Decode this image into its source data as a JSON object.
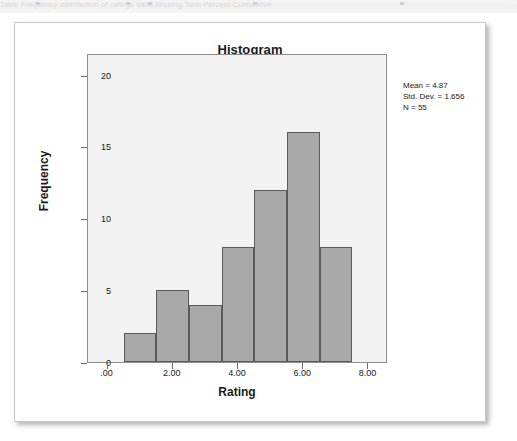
{
  "page": {
    "top_strip_ghost_text": "Table  Frequency distribution of ratings  Valid  Missing  Total  Percent  Cumulative"
  },
  "chart_data": {
    "type": "bar",
    "title": "Histogram",
    "xlabel": "Rating",
    "ylabel": "Frequency",
    "xlim": [
      -0.6,
      8.6
    ],
    "ylim": [
      0,
      21.5
    ],
    "grid": false,
    "legend": "none",
    "bin_width": 1,
    "bin_starts": [
      0.5,
      1.5,
      2.5,
      3.5,
      4.5,
      5.5,
      6.5
    ],
    "bin_ends": [
      1.5,
      2.5,
      3.5,
      4.5,
      5.5,
      6.5,
      7.5
    ],
    "categories": [
      "0.5-1.5",
      "1.5-2.5",
      "2.5-3.5",
      "3.5-4.5",
      "4.5-5.5",
      "5.5-6.5",
      "6.5-7.5"
    ],
    "values": [
      2,
      5,
      4,
      8,
      12,
      16,
      8
    ],
    "xticks": [
      0,
      2,
      4,
      6,
      8
    ],
    "xticklabels": [
      ".00",
      "2.00",
      "4.00",
      "6.00",
      "8.00"
    ],
    "yticks": [
      0,
      5,
      10,
      15,
      20
    ],
    "yticklabels": [
      "0",
      "5",
      "10",
      "15",
      "20"
    ],
    "annotations": [
      "Mean = 4.87",
      "Std. Dev. = 1.656",
      "N = 55"
    ],
    "colors": {
      "bar_fill": "#a9a9a9",
      "bar_border": "#5a5a5a",
      "plot_background": "#f2f2f2",
      "plot_border": "#8d8d8d",
      "text": "#1a1a1a"
    }
  }
}
